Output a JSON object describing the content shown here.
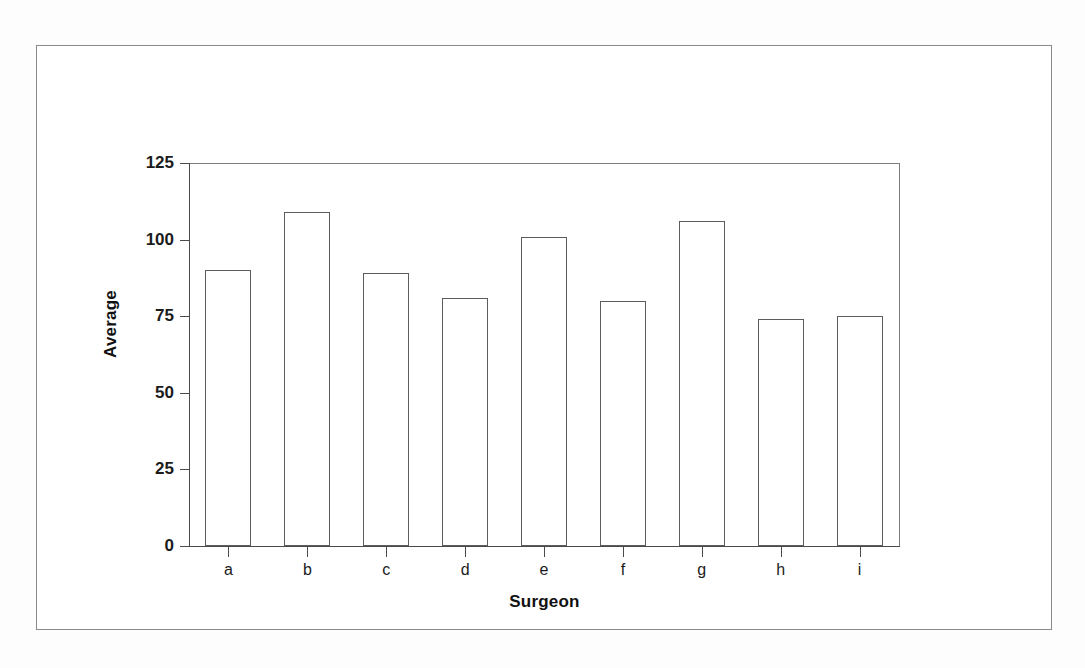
{
  "chart_data": {
    "type": "bar",
    "title": "",
    "subtitle": "",
    "xlabel": "Surgeon",
    "ylabel": "Average",
    "categories": [
      "a",
      "b",
      "c",
      "d",
      "e",
      "f",
      "g",
      "h",
      "i"
    ],
    "values": [
      90,
      109,
      89,
      81,
      101,
      80,
      106,
      74,
      75
    ],
    "series": [
      {
        "name": "Average",
        "values": [
          90,
          109,
          89,
          81,
          101,
          80,
          106,
          74,
          75
        ]
      }
    ],
    "ylim": [
      0,
      125
    ],
    "ytick_labels": [
      "0",
      "25",
      "50",
      "75",
      "100",
      "125"
    ],
    "ytick_values": [
      0,
      25,
      50,
      75,
      100,
      125
    ],
    "xtick_labels": [
      "a",
      "b",
      "c",
      "d",
      "e",
      "f",
      "g",
      "h",
      "i"
    ],
    "grid": false,
    "legend": null,
    "legend_position": "none",
    "bar_fill_color": "#ffffff",
    "bar_border_color": "#5c5c5c",
    "axis_color": "#4a4a4a",
    "background_color": "#ffffff",
    "frame_border_color": "#8a8a8a",
    "annotations": []
  },
  "figure": {
    "frame_label": "chart-frame"
  }
}
